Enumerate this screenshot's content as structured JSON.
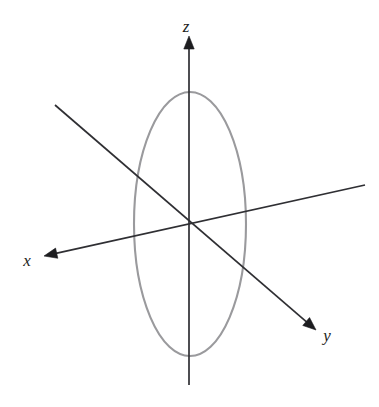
{
  "figure": {
    "kind": "3d-coordinate-axes-with-circle",
    "background_color": "#ffffff",
    "axis_color": "#2f2f33",
    "arrowhead_color": "#1d1d20",
    "circle_color": "#9a9a9d",
    "label_color": "#1d1d20",
    "origin": {
      "x": 189,
      "y": 228
    },
    "axes": [
      {
        "id": "z",
        "label": "z",
        "label_position": {
          "x": 186,
          "y": 32
        },
        "arrow_tip": {
          "x": 189,
          "y": 36
        },
        "line_start": {
          "x": 189,
          "y": 385
        },
        "line_end": {
          "x": 189,
          "y": 46
        },
        "direction": "up"
      },
      {
        "id": "x",
        "label": "x",
        "label_position": {
          "x": 27,
          "y": 266
        },
        "arrow_tip": {
          "x": 44,
          "y": 256
        },
        "line_start": {
          "x": 365,
          "y": 185
        },
        "line_end": {
          "x": 56,
          "y": 254
        },
        "direction": "down-left"
      },
      {
        "id": "y",
        "label": "y",
        "label_position": {
          "x": 327,
          "y": 341
        },
        "arrow_tip": {
          "x": 316,
          "y": 330
        },
        "line_start": {
          "x": 55,
          "y": 105
        },
        "line_end": {
          "x": 304,
          "y": 320
        },
        "direction": "down-right"
      }
    ],
    "circle": {
      "name": "unit-circle-in-yz-plane",
      "center": {
        "x": 190,
        "y": 224
      },
      "radius_x": 56,
      "radius_y": 132,
      "stroke_width": 2.1
    }
  }
}
